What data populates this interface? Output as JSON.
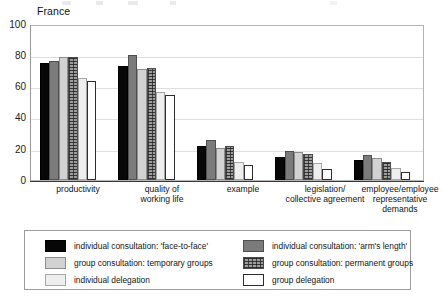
{
  "chart_title": "France",
  "axis": {
    "y_ticks": [
      "100",
      "80",
      "60",
      "40",
      "20",
      "0"
    ],
    "y_min": 0,
    "y_max": 100
  },
  "categories": [
    "productivity",
    "quality of\nworking life",
    "example",
    "legislation/\ncollective agreement",
    "employee/employee\nrepresentative\ndemands"
  ],
  "legend": {
    "items": [
      {
        "label": "individual consultation: 'face-to-face'",
        "fill": "f-black",
        "swatch_name": "swatch-individual-face-to-face"
      },
      {
        "label": "individual consultation: 'arm's length'",
        "fill": "f-darkgray",
        "swatch_name": "swatch-individual-arms-length"
      },
      {
        "label": "group consultation: temporary groups",
        "fill": "f-lightgray",
        "swatch_name": "swatch-group-temporary"
      },
      {
        "label": "group consultation: permanent groups",
        "fill": "f-hatch",
        "swatch_name": "swatch-group-permanent"
      },
      {
        "label": "individual delegation",
        "fill": "f-verylight",
        "swatch_name": "swatch-individual-delegation"
      },
      {
        "label": "group delegation",
        "fill": "f-white",
        "swatch_name": "swatch-group-delegation"
      }
    ]
  },
  "colors": {
    "black": "#070707",
    "dark_gray": "#7b7b7b",
    "light_gray": "#d2d2d2",
    "hatch_gray": "#9d9d9d",
    "very_light_gray": "#eeeeee",
    "white": "#ffffff",
    "gridline": "#dedede",
    "axis": "#3a3a3a"
  },
  "chart_data": {
    "type": "bar",
    "title": "France",
    "xlabel": "",
    "ylabel": "",
    "ylim": [
      0,
      100
    ],
    "grid": true,
    "legend_position": "bottom",
    "categories": [
      "productivity",
      "quality of working life",
      "example",
      "legislation/collective agreement",
      "employee/employee representative demands"
    ],
    "series": [
      {
        "name": "individual consultation: 'face-to-face'",
        "values": [
          76,
          74,
          22,
          15,
          13
        ]
      },
      {
        "name": "individual consultation: 'arm's length'",
        "values": [
          77,
          81,
          26,
          19,
          16
        ]
      },
      {
        "name": "group consultation: temporary groups",
        "values": [
          80,
          72,
          21,
          18,
          14
        ]
      },
      {
        "name": "group consultation: permanent groups",
        "values": [
          80,
          73,
          22,
          17,
          12
        ]
      },
      {
        "name": "individual delegation",
        "values": [
          66,
          57,
          12,
          11,
          8
        ]
      },
      {
        "name": "group delegation",
        "values": [
          64,
          55,
          10,
          7,
          5
        ]
      }
    ]
  }
}
